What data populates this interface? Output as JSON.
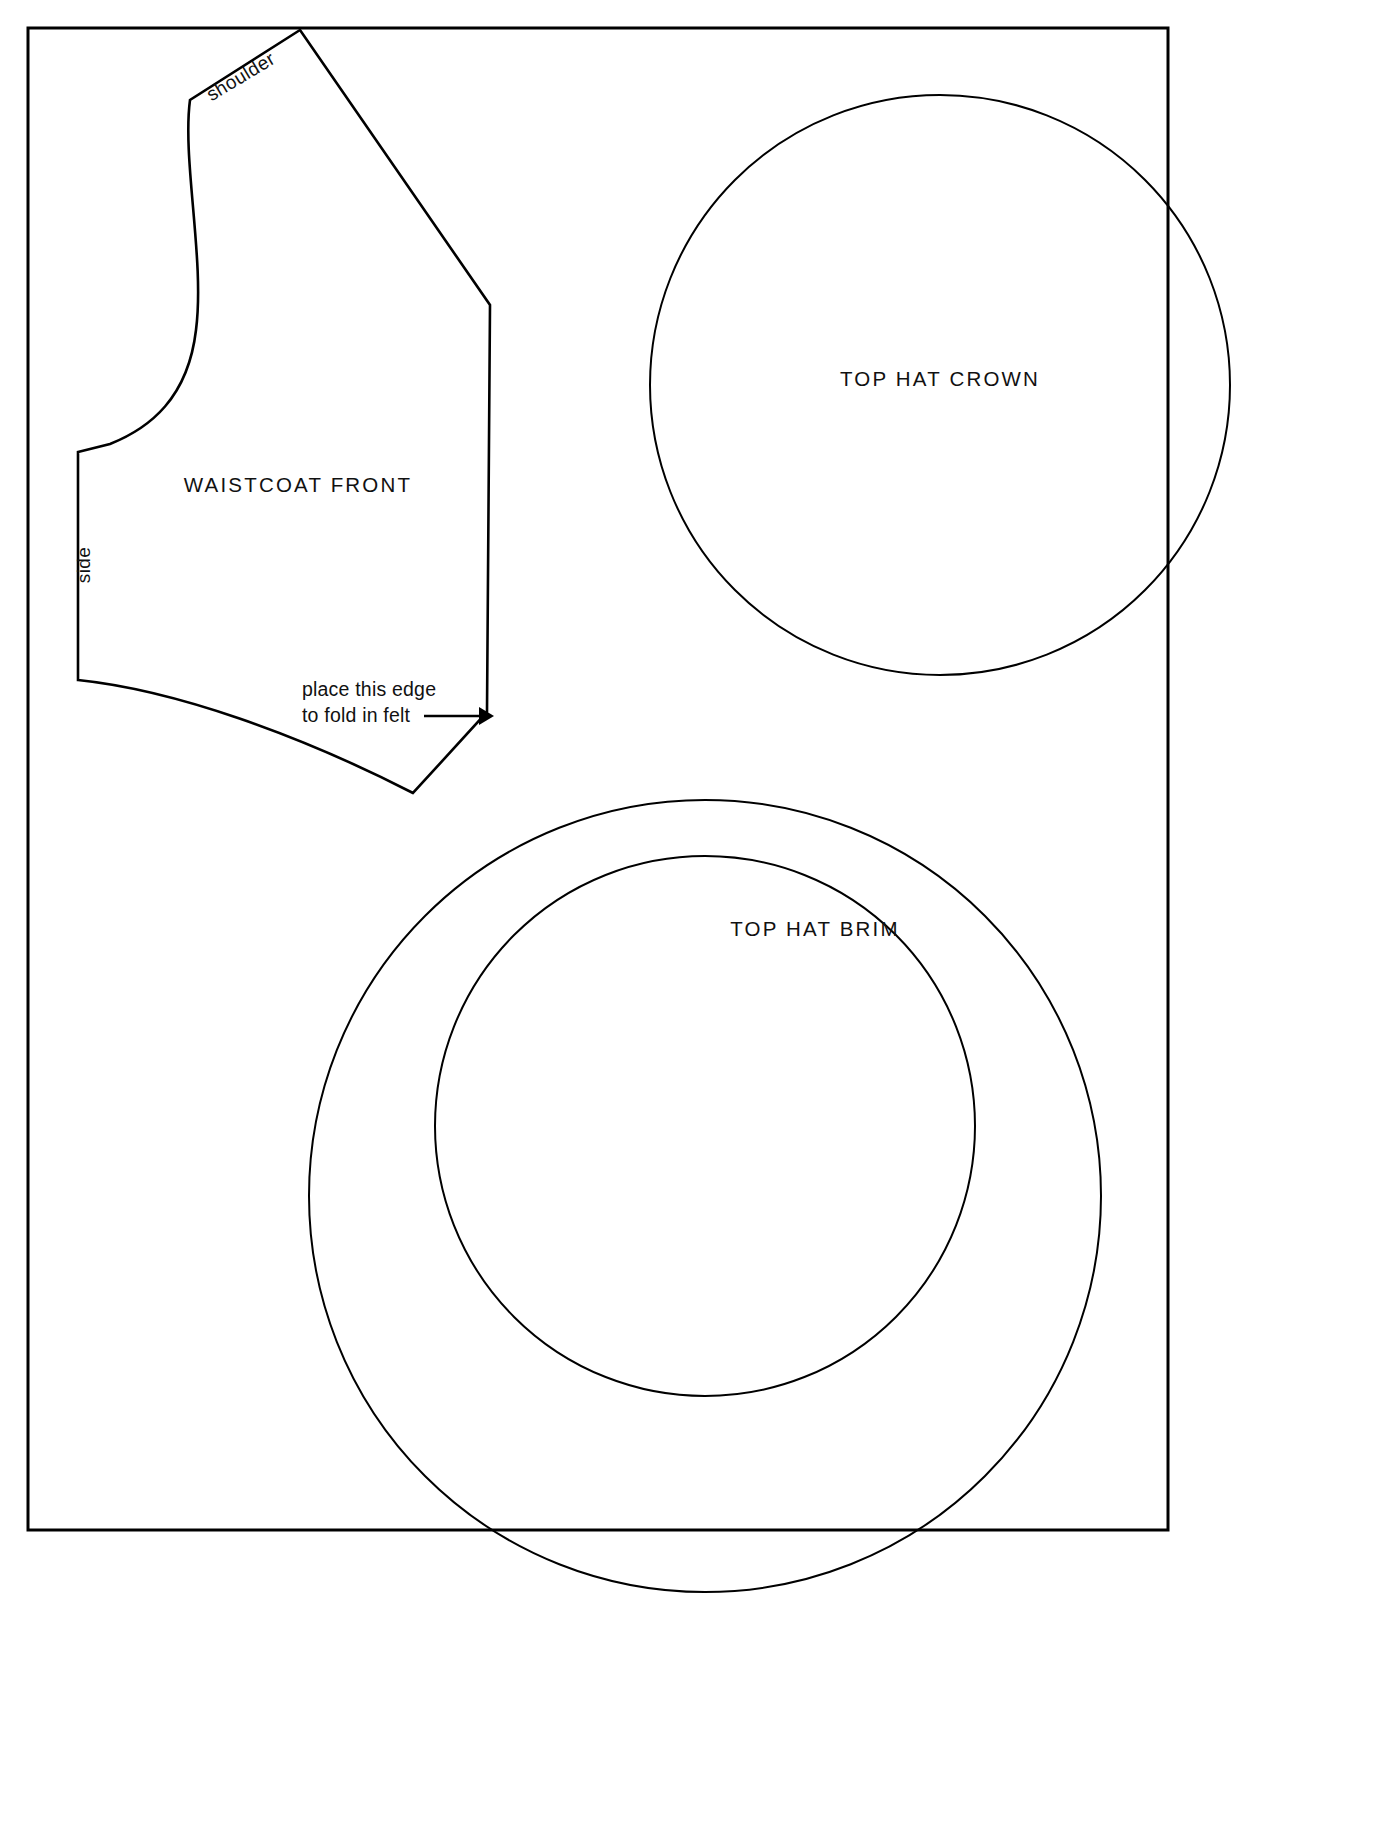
{
  "sheet": {
    "title": "Top Hat and Waistcoat Felt Pattern Sheet",
    "background_color": "#ffffff",
    "ink_color": "#000000",
    "border": {
      "name": "page-border-frame",
      "x": 28,
      "y": 28,
      "width": 1140,
      "height": 1502
    }
  },
  "pieces": [
    {
      "id": "waistcoat-front",
      "label": "WAISTCOAT  FRONT",
      "label_x": 298,
      "label_y": 492,
      "outline": "M 300 30 L 190 100 C 182 160 205 260 196 330 C 188 398 150 428 110 444 L 78 452 L 78 680 C 175 690 300 735 413 793 L 487 712 L 490 305 Z",
      "shape_kind": "polycurve"
    },
    {
      "id": "top-hat-crown",
      "label": "TOP HAT CROWN",
      "label_x": 940,
      "label_y": 386,
      "shape_kind": "circle",
      "cx": 940,
      "cy": 385,
      "r": 290
    },
    {
      "id": "top-hat-brim",
      "label": "TOP HAT BRIM",
      "label_x": 815,
      "label_y": 936,
      "shape_kind": "annulus",
      "outer_cx": 705,
      "outer_cy": 1196,
      "outer_r": 396,
      "inner_cx": 705,
      "inner_cy": 1126,
      "inner_r": 270
    }
  ],
  "annotations": {
    "shoulder": {
      "text": "shoulder",
      "x": 244,
      "y": 82,
      "rotation_deg": -31
    },
    "side": {
      "text": "side",
      "x": 90,
      "y": 565,
      "rotation_deg": -90
    },
    "fold_note": {
      "line1": "place this edge",
      "line2": "to fold in felt",
      "x": 302,
      "y_line1": 696,
      "y_line2": 722,
      "arrow": {
        "name": "fold-edge-arrow",
        "x1": 424,
        "y1": 716,
        "x2": 479,
        "y2": 716,
        "head_points": "479,707 494,716 479,725"
      }
    }
  }
}
